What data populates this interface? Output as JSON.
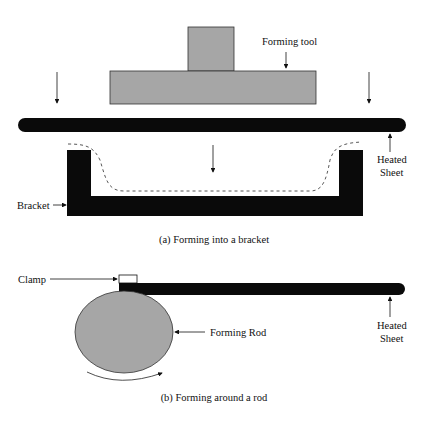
{
  "part_a": {
    "forming_tool_label": "Forming tool",
    "heated_sheet_label_1": "Heated",
    "heated_sheet_label_2": "Sheet",
    "bracket_label": "Bracket",
    "caption": "(a) Forming into a bracket"
  },
  "part_b": {
    "clamp_label": "Clamp",
    "forming_rod_label": "Forming Rod",
    "heated_sheet_label_1": "Heated",
    "heated_sheet_label_2": "Sheet",
    "caption": "(b) Forming around a rod"
  },
  "colors": {
    "tool_gray": "#a6a6a6",
    "sheet_black": "#0a0a0a"
  }
}
